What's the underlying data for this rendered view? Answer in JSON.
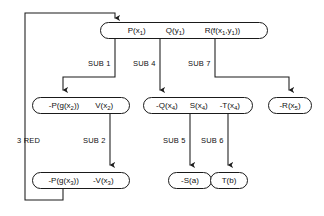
{
  "diagram": {
    "stroke_color": "#1a1a1a",
    "background_color": "#ffffff",
    "nodes": [
      {
        "id": "root",
        "literals": [
          "P(x<sub>1</sub>)",
          "Q(y<sub>1</sub>)",
          "R(f(x<sub>1</sub>,y<sub>1</sub>))"
        ],
        "plain": "P(x1)  Q(y1)  R(f(x1,y1))"
      },
      {
        "id": "n-left-2",
        "literals": [
          "-P(g(x<sub>2</sub>))",
          "V(x<sub>2</sub>)"
        ],
        "plain": "-P(g(x2))  V(x2)"
      },
      {
        "id": "n-mid-2",
        "literals": [
          "-Q(x<sub>4</sub>)",
          "S(x<sub>4</sub>)",
          "-T(x<sub>4</sub>)"
        ],
        "plain": "-Q(x4)  S(x4)  -T(x4)"
      },
      {
        "id": "n-right-2",
        "literals": [
          "-R(x<sub>5</sub>)"
        ],
        "plain": "-R(x5)"
      },
      {
        "id": "n-left-3",
        "literals": [
          "-P(g(x<sub>3</sub>))",
          "-V(x<sub>3</sub>)"
        ],
        "plain": "-P(g(x3))  -V(x3)"
      },
      {
        "id": "n-s-a",
        "literals": [
          "-S(a)"
        ],
        "plain": "-S(a)"
      },
      {
        "id": "n-t-b",
        "literals": [
          "T(b)"
        ],
        "plain": "T(b)"
      }
    ],
    "edge_labels": [
      {
        "id": "sub1",
        "text": "SUB 1"
      },
      {
        "id": "sub4",
        "text": "SUB 4"
      },
      {
        "id": "sub7",
        "text": "SUB 7"
      },
      {
        "id": "red3",
        "text": "3 RED"
      },
      {
        "id": "sub2",
        "text": "SUB 2"
      },
      {
        "id": "sub5",
        "text": "SUB 5"
      },
      {
        "id": "sub6",
        "text": "SUB 6"
      }
    ]
  }
}
